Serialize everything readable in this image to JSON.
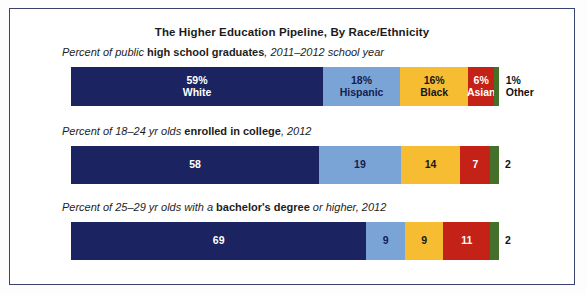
{
  "figure": {
    "title": "The Higher Education Pipeline, By Race/Ethnicity",
    "border_color": "#3a4270",
    "background_color": "#ffffff"
  },
  "palette": {
    "white_navy": "#1b2360",
    "hispanic_blue": "#7ba4d6",
    "black_gold": "#f6bd32",
    "asian_red": "#c42117",
    "other_green": "#44702c"
  },
  "rows": [
    {
      "subtitle_pre": "Percent of public ",
      "subtitle_bold": "high school graduates",
      "subtitle_post": ", 2011–2012 school year",
      "subtitle_plain": "Percent of public high school graduates, 2011–2012 school year",
      "segments": [
        {
          "group": "White",
          "value": 59,
          "value_label": "59%",
          "group_label": "White",
          "color": "#1b2360",
          "text_color": "#ffffff",
          "placement": "inside",
          "show_group_label": true
        },
        {
          "group": "Hispanic",
          "value": 18,
          "value_label": "18%",
          "group_label": "Hispanic",
          "color": "#7ba4d6",
          "text_color": "#14204e",
          "placement": "inside",
          "show_group_label": true
        },
        {
          "group": "Black",
          "value": 16,
          "value_label": "16%",
          "group_label": "Black",
          "color": "#f6bd32",
          "text_color": "#17171a",
          "placement": "inside",
          "show_group_label": true
        },
        {
          "group": "Asian",
          "value": 6,
          "value_label": "6%",
          "group_label": "Asian",
          "color": "#c42117",
          "text_color": "#ffffff",
          "placement": "inside",
          "show_group_label": true
        },
        {
          "group": "Other",
          "value": 1,
          "value_label": "1%",
          "group_label": "Other",
          "color": "#44702c",
          "text_color": "#111111",
          "placement": "outside",
          "show_group_label": true
        }
      ]
    },
    {
      "subtitle_pre": "Percent of 18–24 yr olds ",
      "subtitle_bold": "enrolled in college",
      "subtitle_post": ", 2012",
      "subtitle_plain": "Percent of 18–24 yr olds enrolled in college, 2012",
      "segments": [
        {
          "group": "White",
          "value": 58,
          "value_label": "58",
          "group_label": "White",
          "color": "#1b2360",
          "text_color": "#ffffff",
          "placement": "inside",
          "show_group_label": false
        },
        {
          "group": "Hispanic",
          "value": 19,
          "value_label": "19",
          "group_label": "Hispanic",
          "color": "#7ba4d6",
          "text_color": "#14204e",
          "placement": "inside",
          "show_group_label": false
        },
        {
          "group": "Black",
          "value": 14,
          "value_label": "14",
          "group_label": "Black",
          "color": "#f6bd32",
          "text_color": "#17171a",
          "placement": "inside",
          "show_group_label": false
        },
        {
          "group": "Asian",
          "value": 7,
          "value_label": "7",
          "group_label": "Asian",
          "color": "#c42117",
          "text_color": "#ffffff",
          "placement": "inside",
          "show_group_label": false
        },
        {
          "group": "Other",
          "value": 2,
          "value_label": "2",
          "group_label": "Other",
          "color": "#44702c",
          "text_color": "#111111",
          "placement": "outside",
          "show_group_label": false
        }
      ]
    },
    {
      "subtitle_pre": "Percent of 25–29 yr olds with a ",
      "subtitle_bold": "bachelor's degree",
      "subtitle_post": " or higher, 2012",
      "subtitle_plain": "Percent of 25–29 yr olds with a bachelor's degree or higher, 2012",
      "segments": [
        {
          "group": "White",
          "value": 69,
          "value_label": "69",
          "group_label": "White",
          "color": "#1b2360",
          "text_color": "#ffffff",
          "placement": "inside",
          "show_group_label": false
        },
        {
          "group": "Hispanic",
          "value": 9,
          "value_label": "9",
          "group_label": "Hispanic",
          "color": "#7ba4d6",
          "text_color": "#14204e",
          "placement": "inside",
          "show_group_label": false
        },
        {
          "group": "Black",
          "value": 9,
          "value_label": "9",
          "group_label": "Black",
          "color": "#f6bd32",
          "text_color": "#17171a",
          "placement": "inside",
          "show_group_label": false
        },
        {
          "group": "Asian",
          "value": 11,
          "value_label": "11",
          "group_label": "Asian",
          "color": "#c42117",
          "text_color": "#ffffff",
          "placement": "inside",
          "show_group_label": false
        },
        {
          "group": "Other",
          "value": 2,
          "value_label": "2",
          "group_label": "Other",
          "color": "#44702c",
          "text_color": "#111111",
          "placement": "outside",
          "show_group_label": false
        }
      ]
    }
  ],
  "chart_data": {
    "type": "bar",
    "orientation": "horizontal",
    "stacked": true,
    "normalized": true,
    "title": "The Higher Education Pipeline, By Race/Ethnicity",
    "xlabel": "",
    "ylabel": "",
    "xlim": [
      0,
      100
    ],
    "grid": false,
    "legend": "inline-first-bar",
    "categories": [
      "Percent of public high school graduates, 2011–2012 school year",
      "Percent of 18–24 yr olds enrolled in college, 2012",
      "Percent of 25–29 yr olds with a bachelor's degree or higher, 2012"
    ],
    "series": [
      {
        "name": "White",
        "color": "#1b2360",
        "values": [
          59,
          58,
          69
        ]
      },
      {
        "name": "Hispanic",
        "color": "#7ba4d6",
        "values": [
          18,
          19,
          9
        ]
      },
      {
        "name": "Black",
        "color": "#f6bd32",
        "values": [
          16,
          14,
          9
        ]
      },
      {
        "name": "Asian",
        "color": "#c42117",
        "values": [
          6,
          7,
          11
        ]
      },
      {
        "name": "Other",
        "color": "#44702c",
        "values": [
          1,
          2,
          2
        ]
      }
    ],
    "annotations": [
      "Row 1 segment labels include percent signs and race/ethnicity names",
      "Rows 2 and 3 segment labels show numbers only",
      "The 'Other' value is drawn as a thin green sliver with its label outside the bar"
    ]
  }
}
